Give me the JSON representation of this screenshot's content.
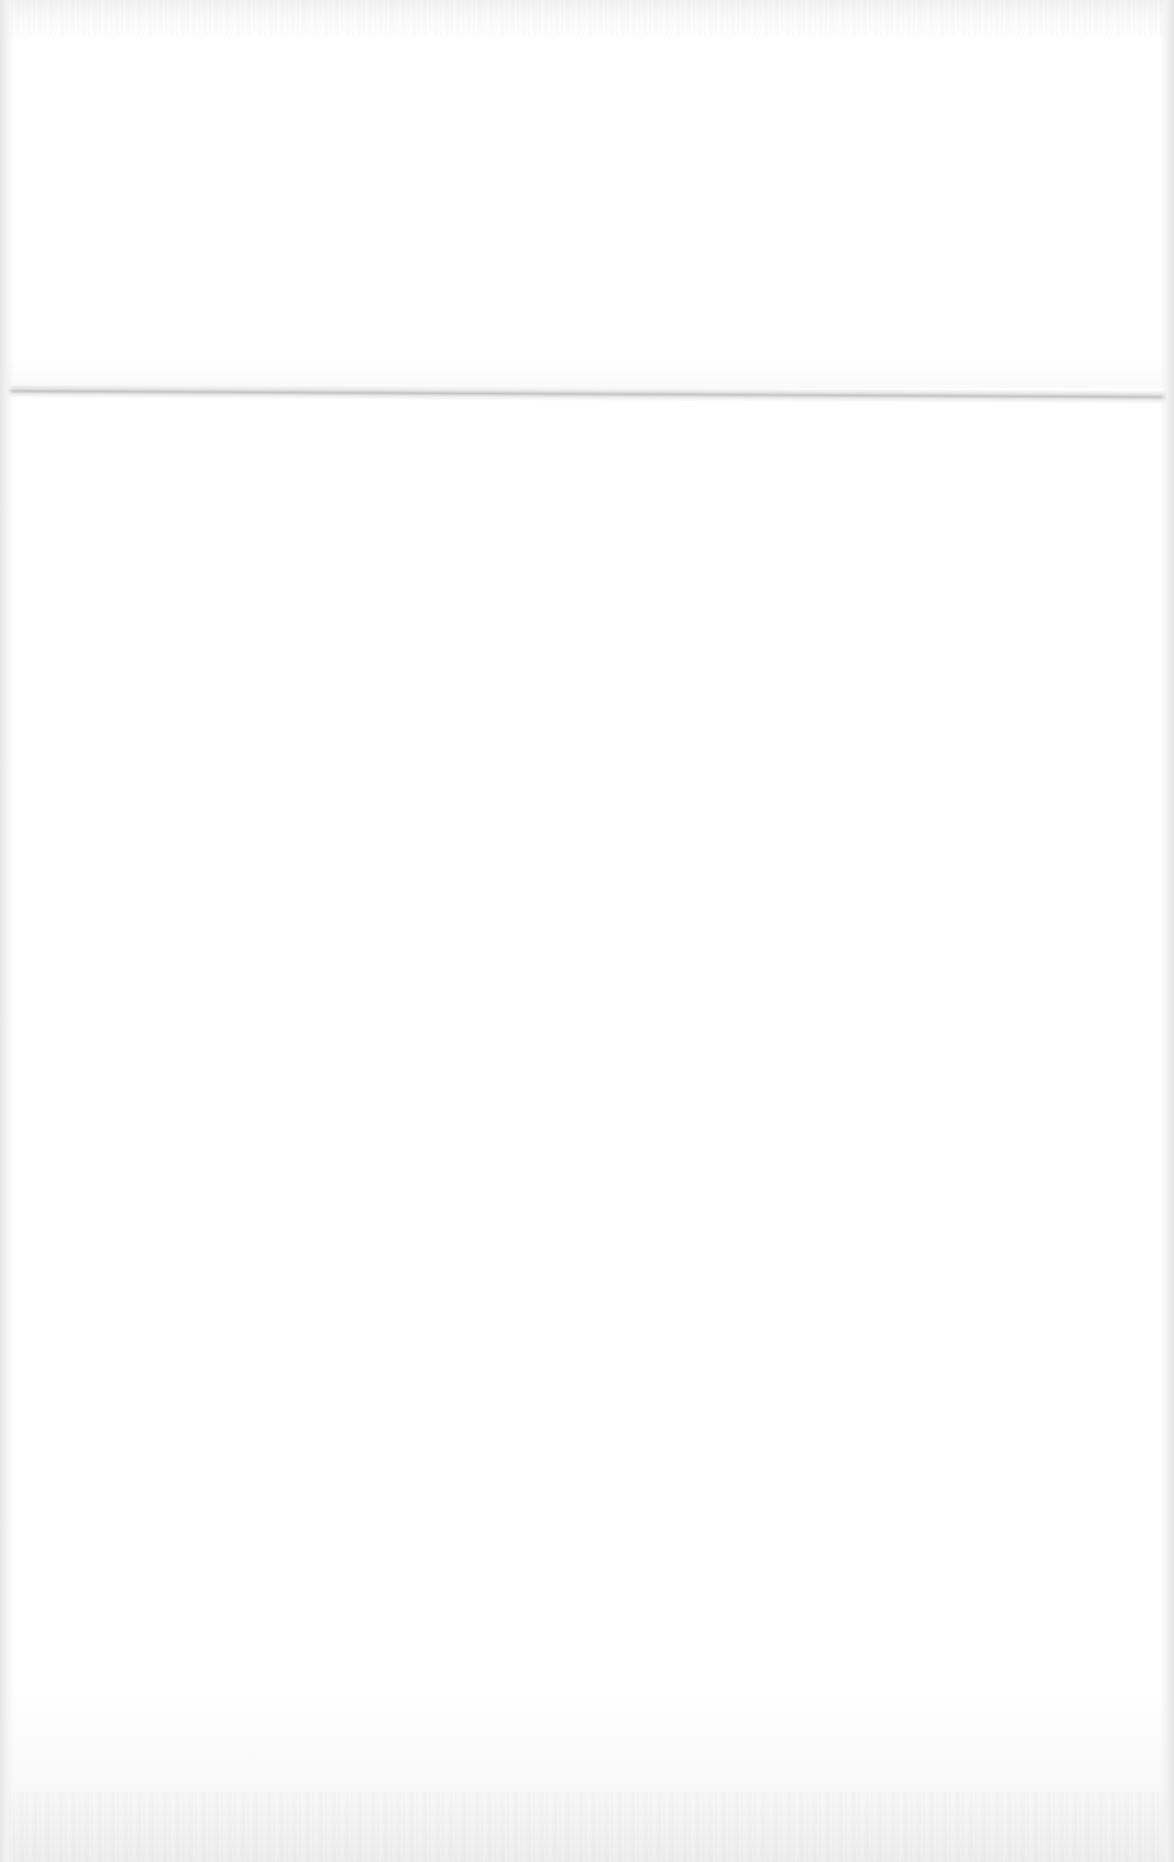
{
  "page": {
    "description": "",
    "content_text": "",
    "visible_features": [
      "horizontal-fold-crease"
    ]
  },
  "colors": {
    "paper": "#ffffff",
    "edge_shadow": "#e6e6e6",
    "crease": "#b9b9b9"
  }
}
